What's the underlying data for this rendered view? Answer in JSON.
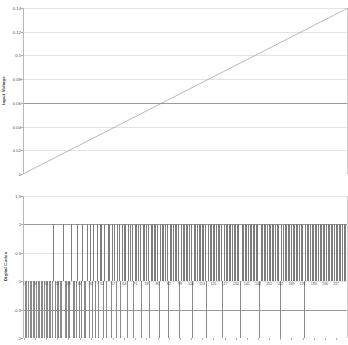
{
  "chart_data": [
    {
      "type": "line",
      "title": "",
      "xlabel": "",
      "ylabel": "Input Voltage",
      "ylim": [
        0,
        0.14
      ],
      "xlim": [
        1,
        204
      ],
      "grid": true,
      "legend": "none",
      "ytick_labels": [
        "0.14",
        "0.12",
        "0.1",
        "0.08",
        "0.06",
        "0.04",
        "0.02",
        "0"
      ],
      "ytick_values": [
        0.14,
        0.12,
        0.1,
        0.08,
        0.06,
        0.04,
        0.02,
        0
      ],
      "series": [
        {
          "name": "Input Voltage",
          "color": "#9c9c9c",
          "x": [
            1,
            204
          ],
          "values": [
            0.0,
            0.14
          ]
        }
      ]
    },
    {
      "type": "bar",
      "title": "",
      "xlabel": "",
      "ylabel": "Digital Codes",
      "ylim": [
        -1,
        1.5
      ],
      "grid": true,
      "legend": "none",
      "ytick_labels": [
        "1.5",
        "1",
        "0.5",
        "0",
        "-0.5",
        "-1"
      ],
      "ytick_values": [
        1.5,
        1,
        0.5,
        0,
        -0.5,
        -1
      ],
      "xtick_labels": [
        "1",
        "8",
        "15",
        "22",
        "29",
        "36",
        "43",
        "50",
        "57",
        "64",
        "71",
        "78",
        "85",
        "92",
        "99",
        "106",
        "113",
        "120",
        "127",
        "134",
        "141",
        "148",
        "155",
        "162",
        "169",
        "176",
        "183",
        "190",
        "197"
      ],
      "xtick_step": 7,
      "n_categories": 204,
      "bar_color_positive": "#7d7d7d",
      "bar_color_negative": "#8a8a8a",
      "series": [
        {
          "name": "Digital Codes",
          "values": [
            -1,
            -1,
            -1,
            -1,
            -1,
            -1,
            -1,
            -1,
            -1,
            -1,
            -1,
            -1,
            -1,
            -1,
            -1,
            -1,
            -1,
            -1,
            -1,
            1,
            -1,
            -1,
            -1,
            -1,
            -1,
            1,
            -1,
            -1,
            -1,
            -1,
            1,
            -1,
            -1,
            -1,
            1,
            -1,
            -1,
            1,
            -1,
            -1,
            1,
            -1,
            1,
            -1,
            1,
            -1,
            1,
            -1,
            1,
            1,
            -1,
            1,
            -1,
            1,
            1,
            -1,
            1,
            1,
            -1,
            1,
            1,
            -1,
            1,
            1,
            1,
            -1,
            1,
            1,
            1,
            -1,
            1,
            1,
            1,
            1,
            -1,
            1,
            1,
            1,
            1,
            -1,
            1,
            1,
            1,
            1,
            1,
            -1,
            1,
            1,
            1,
            1,
            1,
            -1,
            1,
            1,
            1,
            1,
            1,
            1,
            -1,
            1,
            1,
            1,
            1,
            1,
            1,
            1,
            -1,
            1,
            1,
            1,
            1,
            1,
            1,
            1,
            1,
            -1,
            1,
            1,
            1,
            1,
            1,
            1,
            1,
            1,
            1,
            -1,
            1,
            1,
            1,
            1,
            1,
            1,
            1,
            1,
            1,
            1,
            -1,
            1,
            1,
            1,
            1,
            1,
            1,
            1,
            1,
            1,
            1,
            1,
            -1,
            1,
            1,
            1,
            1,
            1,
            1,
            1,
            1,
            1,
            1,
            1,
            1,
            -1,
            1,
            1,
            1,
            1,
            1,
            1,
            1,
            1,
            1,
            1,
            1,
            1,
            1,
            1,
            -1,
            1,
            1,
            1,
            1,
            1,
            1,
            1,
            1,
            1,
            1,
            1,
            1,
            1,
            1,
            1,
            1,
            1,
            1,
            1,
            1,
            1,
            1,
            1,
            1,
            1
          ]
        }
      ]
    }
  ]
}
